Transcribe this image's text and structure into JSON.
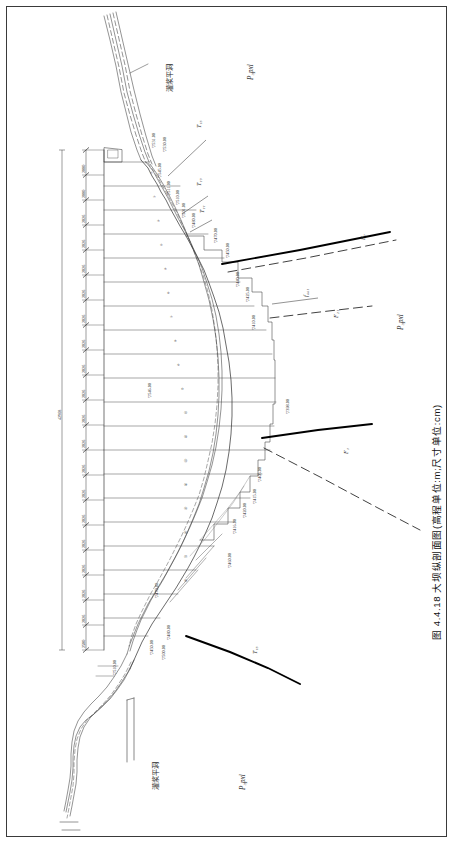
{
  "drawing": {
    "caption": "图 4.4.18  大坝纵剖面图(高程单位:m;尺寸单位:cm)",
    "figure_number": "图 4.4.18",
    "title": "大坝纵剖面图",
    "units_note": "(高程单位:m;尺寸单位:cm)",
    "overall_dimension": "42968"
  },
  "annotations": {
    "grout_adit_top": "灌浆平洞",
    "grout_adit_bottom": "灌浆平洞"
  },
  "geology": {
    "unit_top_right": "P₃pxl",
    "unit_mid_right": "P₃pxl",
    "unit_bottom": "P₃pxl",
    "formations": [
      {
        "label": "T₁₅",
        "x": 196,
        "y": 128
      },
      {
        "label": "T₁₃",
        "x": 196,
        "y": 186
      },
      {
        "label": "T₁₁",
        "x": 199,
        "y": 213
      },
      {
        "label": "T₁₅",
        "x": 252,
        "y": 654
      }
    ],
    "faults": [
      {
        "label": "F₇",
        "x": 360,
        "y": 240
      },
      {
        "label": "f₄₄₁",
        "x": 303,
        "y": 297
      },
      {
        "label": "F₂₁",
        "x": 333,
        "y": 318
      },
      {
        "label": "F₁",
        "x": 343,
        "y": 454
      }
    ]
  },
  "elevations": [
    {
      "value": "▽531.00",
      "x": 152,
      "y": 148
    },
    {
      "value": "▽530.00",
      "x": 163,
      "y": 152
    },
    {
      "value": "▽545.00",
      "x": 158,
      "y": 178
    },
    {
      "value": "▽511.00",
      "x": 167,
      "y": 196
    },
    {
      "value": "▽510.00",
      "x": 176,
      "y": 205
    },
    {
      "value": "▽501.00",
      "x": 182,
      "y": 218
    },
    {
      "value": "▽480.00",
      "x": 192,
      "y": 228
    },
    {
      "value": "▽470.00",
      "x": 214,
      "y": 243
    },
    {
      "value": "▽450.00",
      "x": 226,
      "y": 258
    },
    {
      "value": "▽440.00",
      "x": 236,
      "y": 287
    },
    {
      "value": "▽425.00",
      "x": 246,
      "y": 302
    },
    {
      "value": "▽410.00",
      "x": 252,
      "y": 330
    },
    {
      "value": "▽546.00",
      "x": 148,
      "y": 398
    },
    {
      "value": "▽398.00",
      "x": 286,
      "y": 414
    },
    {
      "value": "▽405.00",
      "x": 258,
      "y": 482
    },
    {
      "value": "▽415.00",
      "x": 253,
      "y": 504
    },
    {
      "value": "▽420.00",
      "x": 243,
      "y": 518
    },
    {
      "value": "▽416.00",
      "x": 233,
      "y": 534
    },
    {
      "value": "▽460.00",
      "x": 228,
      "y": 568
    },
    {
      "value": "▽470.00",
      "x": 155,
      "y": 598
    },
    {
      "value": "▽480.00",
      "x": 167,
      "y": 640
    },
    {
      "value": "▽450.00",
      "x": 150,
      "y": 655
    },
    {
      "value": "▽500.00",
      "x": 162,
      "y": 660
    },
    {
      "value": "▽510.00",
      "x": 113,
      "y": 675
    }
  ],
  "dimension_chain": {
    "total": "42968",
    "segments": [
      "2000",
      "2000",
      "2026",
      "2026",
      "2026",
      "2026",
      "2026",
      "2026",
      "2026",
      "2026",
      "2026",
      "2026",
      "2026",
      "2026",
      "2026",
      "2026",
      "2026",
      "2026",
      "2026",
      "2500"
    ]
  },
  "block_numbers": [
    "①",
    "②",
    "③",
    "④",
    "⑤",
    "⑥",
    "⑦",
    "⑧",
    "⑨",
    "⑩",
    "⑪",
    "⑫",
    "⑬",
    "⑭",
    "⑮",
    "⑯",
    "⑰",
    "⑱"
  ],
  "colors": {
    "line": "#3a3a3a",
    "thick_fault": "#000000",
    "text": "#2b2b2b",
    "frame": "#3a3a3a"
  }
}
